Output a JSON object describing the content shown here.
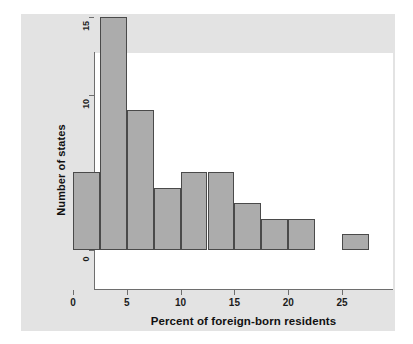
{
  "chart_data": {
    "type": "bar",
    "title": "",
    "subtitle": "",
    "xlabel": "Percent of foreign-born residents",
    "ylabel": "Number of states",
    "xlim": [
      -1.5,
      28.5
    ],
    "ylim": [
      0,
      15.8
    ],
    "xticks": [
      0,
      5,
      10,
      15,
      20,
      25
    ],
    "xticklabels": [
      "0",
      "5",
      "10",
      "15",
      "20",
      "25"
    ],
    "yticks": [
      0,
      5,
      10,
      15
    ],
    "yticklabels": [
      "0",
      "5",
      "10",
      "15"
    ],
    "grid": false,
    "legend": null,
    "bin_width": 2.5,
    "bins": [
      {
        "left": 0.0,
        "right": 2.5,
        "count": 5
      },
      {
        "left": 2.5,
        "right": 5.0,
        "count": 15
      },
      {
        "left": 5.0,
        "right": 7.5,
        "count": 9
      },
      {
        "left": 7.5,
        "right": 10.0,
        "count": 4
      },
      {
        "left": 10.0,
        "right": 12.5,
        "count": 5
      },
      {
        "left": 12.5,
        "right": 15.0,
        "count": 5
      },
      {
        "left": 15.0,
        "right": 17.5,
        "count": 3
      },
      {
        "left": 17.5,
        "right": 20.0,
        "count": 2
      },
      {
        "left": 20.0,
        "right": 22.5,
        "count": 2
      },
      {
        "left": 22.5,
        "right": 25.0,
        "count": 0
      },
      {
        "left": 25.0,
        "right": 27.5,
        "count": 1
      }
    ],
    "categories": [
      "0-2.5",
      "2.5-5",
      "5-7.5",
      "7.5-10",
      "10-12.5",
      "12.5-15",
      "15-17.5",
      "17.5-20",
      "20-22.5",
      "22.5-25",
      "25-27.5"
    ],
    "values": [
      5,
      15,
      9,
      4,
      5,
      5,
      3,
      2,
      2,
      0,
      1
    ],
    "colors": {
      "bar_fill": "#acacac",
      "bar_edge": "#4a4a4a",
      "axis": "#6e6e6e",
      "panel_background": "#e3e3e3",
      "plot_background": "#ffffff",
      "text": "#111111"
    }
  }
}
